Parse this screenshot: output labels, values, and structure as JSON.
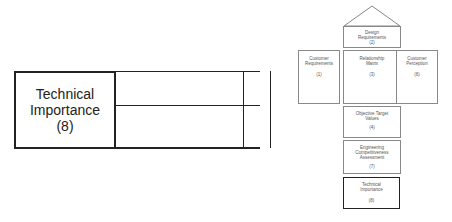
{
  "enlarged_view": {
    "label_lines": [
      "Technical",
      "Importance",
      "(8)"
    ]
  },
  "house_of_quality": {
    "roof": {
      "label": "Design Requirements",
      "number": "(2)"
    },
    "customer_requirements": {
      "label": "Customer Requirements",
      "number": "(1)"
    },
    "relationship_matrix": {
      "label": "Relationship Matrix",
      "number": "(3)"
    },
    "customer_perception": {
      "label": "Customer Perception",
      "number": "(6)"
    },
    "objective_target_values": {
      "label": "Objective Target Values",
      "number": "(4)"
    },
    "engineering_assessment": {
      "label": "Engineering Competitiveness Assessment",
      "number": "(7)"
    },
    "technical_importance": {
      "label": "Technical Importance",
      "number": "(8)"
    }
  },
  "colors": {
    "line": "#222222",
    "box_border": "#888888",
    "highlight_border": "#222222"
  }
}
